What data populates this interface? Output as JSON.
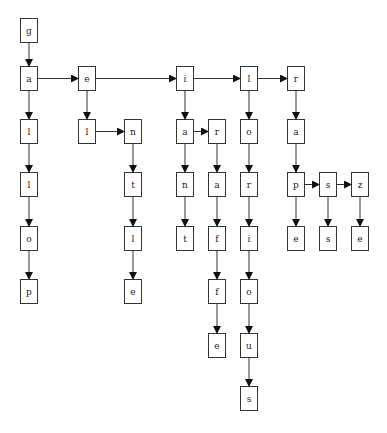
{
  "diagram": {
    "type": "trie",
    "words": [
      "gallop",
      "gel",
      "gentle",
      "giant",
      "giraffe",
      "glorious",
      "grape",
      "grass",
      "graze"
    ],
    "nodes": [
      {
        "id": "n0",
        "label": "g",
        "x": 20,
        "y": 18
      },
      {
        "id": "n1",
        "label": "a",
        "x": 20,
        "y": 66
      },
      {
        "id": "n2",
        "label": "l",
        "x": 20,
        "y": 119
      },
      {
        "id": "n3",
        "label": "l",
        "x": 20,
        "y": 172
      },
      {
        "id": "n4",
        "label": "o",
        "x": 20,
        "y": 226
      },
      {
        "id": "n5",
        "label": "p",
        "x": 20,
        "y": 279
      },
      {
        "id": "n6",
        "label": "e",
        "x": 78,
        "y": 66
      },
      {
        "id": "n7",
        "label": "l",
        "x": 78,
        "y": 119
      },
      {
        "id": "n8",
        "label": "n",
        "x": 124,
        "y": 119
      },
      {
        "id": "n9",
        "label": "t",
        "x": 124,
        "y": 172
      },
      {
        "id": "n10",
        "label": "l",
        "x": 124,
        "y": 226
      },
      {
        "id": "n11",
        "label": "e",
        "x": 124,
        "y": 279
      },
      {
        "id": "n12",
        "label": "i",
        "x": 176,
        "y": 66
      },
      {
        "id": "n13",
        "label": "a",
        "x": 176,
        "y": 119
      },
      {
        "id": "n14",
        "label": "n",
        "x": 176,
        "y": 172
      },
      {
        "id": "n15",
        "label": "t",
        "x": 176,
        "y": 226
      },
      {
        "id": "n16",
        "label": "r",
        "x": 208,
        "y": 119
      },
      {
        "id": "n17",
        "label": "a",
        "x": 208,
        "y": 172
      },
      {
        "id": "n18",
        "label": "f",
        "x": 208,
        "y": 226
      },
      {
        "id": "n19",
        "label": "f",
        "x": 208,
        "y": 279
      },
      {
        "id": "n20",
        "label": "e",
        "x": 208,
        "y": 333
      },
      {
        "id": "n21",
        "label": "l",
        "x": 240,
        "y": 66
      },
      {
        "id": "n22",
        "label": "o",
        "x": 240,
        "y": 119
      },
      {
        "id": "n23",
        "label": "r",
        "x": 240,
        "y": 172
      },
      {
        "id": "n24",
        "label": "i",
        "x": 240,
        "y": 226
      },
      {
        "id": "n25",
        "label": "o",
        "x": 240,
        "y": 279
      },
      {
        "id": "n26",
        "label": "u",
        "x": 240,
        "y": 333
      },
      {
        "id": "n27",
        "label": "s",
        "x": 240,
        "y": 386
      },
      {
        "id": "n28",
        "label": "r",
        "x": 287,
        "y": 66
      },
      {
        "id": "n29",
        "label": "a",
        "x": 287,
        "y": 119
      },
      {
        "id": "n30",
        "label": "p",
        "x": 287,
        "y": 172
      },
      {
        "id": "n31",
        "label": "e",
        "x": 287,
        "y": 226
      },
      {
        "id": "n32",
        "label": "s",
        "x": 319,
        "y": 172
      },
      {
        "id": "n33",
        "label": "s",
        "x": 319,
        "y": 226
      },
      {
        "id": "n34",
        "label": "z",
        "x": 351,
        "y": 172
      },
      {
        "id": "n35",
        "label": "e",
        "x": 351,
        "y": 226
      }
    ],
    "edges": [
      [
        "n0",
        "n1",
        "down"
      ],
      [
        "n1",
        "n2",
        "down"
      ],
      [
        "n2",
        "n3",
        "down"
      ],
      [
        "n3",
        "n4",
        "down"
      ],
      [
        "n4",
        "n5",
        "down"
      ],
      [
        "n1",
        "n6",
        "right"
      ],
      [
        "n6",
        "n7",
        "down"
      ],
      [
        "n7",
        "n8",
        "right"
      ],
      [
        "n8",
        "n9",
        "down"
      ],
      [
        "n9",
        "n10",
        "down"
      ],
      [
        "n10",
        "n11",
        "down"
      ],
      [
        "n6",
        "n12",
        "right"
      ],
      [
        "n12",
        "n13",
        "down"
      ],
      [
        "n13",
        "n14",
        "down"
      ],
      [
        "n14",
        "n15",
        "down"
      ],
      [
        "n13",
        "n16",
        "right"
      ],
      [
        "n16",
        "n17",
        "down"
      ],
      [
        "n17",
        "n18",
        "down"
      ],
      [
        "n18",
        "n19",
        "down"
      ],
      [
        "n19",
        "n20",
        "down"
      ],
      [
        "n12",
        "n21",
        "right"
      ],
      [
        "n21",
        "n22",
        "down"
      ],
      [
        "n22",
        "n23",
        "down"
      ],
      [
        "n23",
        "n24",
        "down"
      ],
      [
        "n24",
        "n25",
        "down"
      ],
      [
        "n25",
        "n26",
        "down"
      ],
      [
        "n26",
        "n27",
        "down"
      ],
      [
        "n21",
        "n28",
        "right"
      ],
      [
        "n28",
        "n29",
        "down"
      ],
      [
        "n29",
        "n30",
        "down"
      ],
      [
        "n30",
        "n31",
        "down"
      ],
      [
        "n30",
        "n32",
        "right"
      ],
      [
        "n32",
        "n33",
        "down"
      ],
      [
        "n32",
        "n34",
        "right"
      ],
      [
        "n34",
        "n35",
        "down"
      ]
    ]
  }
}
